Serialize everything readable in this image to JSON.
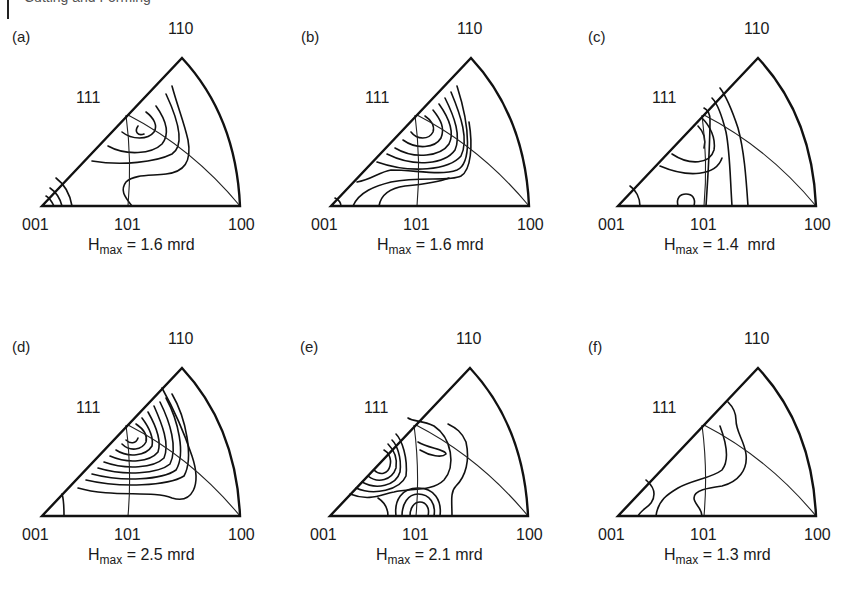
{
  "header": {
    "text": "Cutting and Forming"
  },
  "chart_data": [
    {
      "type": "inverse_pole_figure",
      "id": "a",
      "panel_label": "(a)",
      "title": "",
      "poles": {
        "origin": "001",
        "right": "100",
        "apex": "110",
        "edge_mid": "111",
        "base_mid": "101"
      },
      "hmax_label": "H",
      "hmax_sub": "max",
      "hmax_value": " = 1.6 mrd",
      "h_max_mrd": 1.6,
      "contour_peak_near": "111",
      "contours": [
        "M 96 -80 C 92 -74, 96 -70, 102 -72",
        "M 80 -74 C 90 -66, 106 -66, 112 -74 C 116 -80, 112 -88, 104 -94",
        "M 66 -60 C 84 -50, 110 -52, 120 -62 C 128 -72, 124 -86, 114 -100",
        "M 50 -45 C 80 -40, 114 -44, 130 -52 C 142 -60, 138 -82, 124 -112",
        "M 90 0 C 82 -10, 78 -16, 84 -24 C 92 -32, 110 -30, 124 -32 C 142 -34, 150 -44, 146 -66 C 142 -84, 136 -98, 130 -120",
        "M 30 0 C 28 -12, 22 -22, 14 -28",
        "M 20 0 C 18 -8, 14 -14, 8 -18",
        "M 12 0 C 10 -4, 8 -8, 4 -10"
      ]
    },
    {
      "type": "inverse_pole_figure",
      "id": "b",
      "panel_label": "(b)",
      "poles": {
        "origin": "001",
        "right": "100",
        "apex": "110",
        "edge_mid": "111",
        "base_mid": "101"
      },
      "hmax_label": "H",
      "hmax_sub": "max",
      "hmax_value": " = 1.6 mrd",
      "h_max_mrd": 1.6,
      "contour_peak_near": "111",
      "contours": [
        "M 80 -74 C 86 -66, 98 -66, 102 -74 C 104 -80, 100 -86, 94 -90",
        "M 72 -66 C 86 -56, 104 -58, 110 -68 C 114 -78, 110 -86, 102 -96",
        "M 64 -58 C 84 -46, 110 -50, 118 -62 C 124 -74, 118 -88, 108 -102",
        "M 56 -52 C 84 -38, 114 -42, 124 -56 C 130 -70, 124 -88, 114 -108",
        "M 46 -44 C 80 -32, 118 -36, 130 -50 C 138 -66, 130 -90, 120 -114",
        "M 26 -24 C 40 -26, 48 -34, 60 -36 C 84 -36, 110 -30, 126 -36 C 140 -42, 140 -76, 126 -120",
        "M 22 0 C 28 -14, 44 -20, 60 -24 C 90 -30, 118 -24, 130 -30 C 140 -36, 142 -60, 138 -84",
        "M 48 0 C 50 -12, 60 -18, 74 -20 C 96 -22, 108 -24, 118 -28",
        "M 10 0 C 10 -4, 8 -6, 4 -8"
      ]
    },
    {
      "type": "inverse_pole_figure",
      "id": "c",
      "panel_label": "(c)",
      "poles": {
        "origin": "001",
        "right": "100",
        "apex": "110",
        "edge_mid": "111",
        "base_mid": "101"
      },
      "hmax_label": "H",
      "hmax_sub": "max",
      "hmax_value": " = 1.4  mrd",
      "h_max_mrd": 1.4,
      "contour_peak_near": "111",
      "contours": [
        "M 80 -80 C 86 -74, 88 -66, 86 -58",
        "M 54 -52 C 72 -40, 92 -42, 96 -56 C 98 -68, 92 -80, 84 -88",
        "M 42 -40 C 70 -28, 98 -30, 104 -48",
        "M 88 0 C 90 -30, 92 -60, 92 -86 C 92 -92, 90 -96, 86 -98",
        "M 114 0 C 112 -30, 112 -54, 108 -74 C 104 -90, 100 -102, 94 -108",
        "M 130 0 C 128 -30, 126 -56, 120 -78 C 114 -96, 108 -110, 102 -118",
        "M 60 0 C 58 -8, 62 -12, 68 -12 C 74 -12, 78 -8, 76 0",
        "M 22 0 C 22 -8, 18 -16, 12 -20"
      ]
    },
    {
      "type": "inverse_pole_figure",
      "id": "d",
      "panel_label": "(d)",
      "poles": {
        "origin": "001",
        "right": "100",
        "apex": "110",
        "edge_mid": "111",
        "base_mid": "101"
      },
      "hmax_label": "H",
      "hmax_sub": "max",
      "hmax_value": " = 2.5 mrd",
      "h_max_mrd": 2.5,
      "contour_peak_near": "111",
      "contours": [
        "M 84 -76 C 88 -72, 94 -72, 96 -78",
        "M 80 -72 C 88 -64, 100 -66, 104 -74 C 106 -82, 100 -88, 94 -92",
        "M 74 -66 C 86 -58, 104 -60, 110 -70 C 112 -80, 106 -90, 100 -98",
        "M 68 -60 C 86 -52, 108 -54, 116 -64 C 120 -76, 114 -90, 106 -104",
        "M 62 -54 C 84 -46, 112 -48, 122 -58 C 128 -72, 120 -92, 112 -110",
        "M 56 -48 C 82 -40, 116 -42, 128 -52 C 136 -68, 128 -94, 118 -114",
        "M 50 -42 C 80 -34, 120 -36, 134 -46 C 144 -62, 136 -96, 124 -118",
        "M 44 -36 C 78 -28, 126 -30, 142 -40 C 152 -58, 144 -98, 130 -122",
        "M 36 -28 C 70 -18, 110 -26, 130 -18 C 150 -12, 160 -30, 150 -60 C 142 -84, 130 -110, 120 -128",
        "M 22 0 C 22 -8, 22 -16, 20 -22"
      ]
    },
    {
      "type": "inverse_pole_figure",
      "id": "e",
      "panel_label": "(e)",
      "poles": {
        "origin": "001",
        "right": "100",
        "apex": "110",
        "edge_mid": "111",
        "base_mid": "101"
      },
      "hmax_label": "H",
      "hmax_sub": "max",
      "hmax_value": " = 2.1 mrd",
      "h_max_mrd": 2.1,
      "contour_peak_near": "between 001 and 111",
      "contours": [
        "M 44 -46 C 50 -40, 58 -42, 60 -50 C 62 -58, 58 -64, 54 -66",
        "M 38 -40 C 48 -32, 62 -36, 66 -48 C 68 -60, 62 -68, 58 -72",
        "M 32 -34 C 46 -26, 66 -30, 70 -44 C 72 -60, 66 -72, 62 -76",
        "M 26 -28 C 44 -20, 70 -26, 76 -40 C 78 -58, 72 -76, 66 -82",
        "M 20 -22 C 40 -14, 52 -22, 64 -24 C 80 -28, 102 -24, 114 -36 C 126 -50, 122 -78, 104 -90 C 92 -96, 84 -94, 78 -98",
        "M 88 -74 C 98 -68, 116 -66, 116 -62 C 112 -58, 100 -60, 90 -66",
        "M 58 0 C 58 -8, 54 -14, 48 -18",
        "M 66 0 C 64 -16, 72 -28, 88 -28 C 104 -28, 112 -16, 110 0",
        "M 72 0 C 72 -12, 78 -22, 88 -22 C 100 -22, 106 -12, 104 0",
        "M 80 0 C 80 -8, 84 -14, 90 -14 C 96 -14, 100 -8, 98 0",
        "M 122 0 C 122 -14, 120 -24, 126 -30 C 136 -40, 140 -56, 136 -74 C 132 -84, 126 -88, 118 -92"
      ]
    },
    {
      "type": "inverse_pole_figure",
      "id": "f",
      "panel_label": "(f)",
      "poles": {
        "origin": "001",
        "right": "100",
        "apex": "110",
        "edge_mid": "111",
        "base_mid": "101"
      },
      "hmax_label": "H",
      "hmax_sub": "max",
      "hmax_value": " = 1.3 mrd",
      "h_max_mrd": 1.3,
      "contour_peak_near": "111",
      "contours": [
        "M 84 0 C 84 -8, 76 -12, 76 -18 C 76 -26, 90 -28, 104 -30 C 120 -34, 130 -46, 128 -62 C 126 -76, 118 -84, 118 -96 C 118 -104, 114 -110, 110 -114",
        "M 38 0 C 40 -16, 50 -22, 60 -28 C 74 -36, 94 -38, 104 -46 C 112 -56, 108 -74, 102 -90",
        "M 20 0 C 24 -8, 36 -10, 36 -22 C 36 -30, 30 -34, 28 -36"
      ]
    }
  ]
}
